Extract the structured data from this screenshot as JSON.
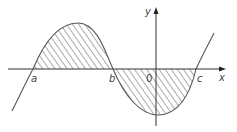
{
  "diagram": {
    "labels": {
      "x_axis": "x",
      "y_axis": "y",
      "origin": "0",
      "root_a": "a",
      "root_b": "b",
      "root_c": "c"
    },
    "colors": {
      "curve": "#555555",
      "axis": "#333333",
      "hatch": "#444444",
      "background": "#ffffff"
    },
    "shading": "diagonal hatching between curve and x-axis from a to b (above) and b to c (below)"
  }
}
